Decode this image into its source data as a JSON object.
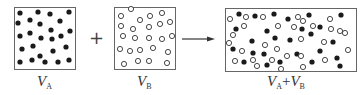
{
  "diagram": {
    "title": "",
    "colors": {
      "stroke": "#555555",
      "filled": "#1a1a1a",
      "hollow_fill": "#ffffff"
    },
    "containers": [
      {
        "id": "A",
        "label_main": "V",
        "label_sub": "A",
        "particle_type": "filled",
        "count": 28
      },
      {
        "id": "B",
        "label_main": "V",
        "label_sub": "B",
        "particle_type": "hollow",
        "count": 28
      },
      {
        "id": "AB",
        "label_main": "V",
        "label_sub": "A",
        "label_plus": "+",
        "label_main2": "V",
        "label_sub2": "B",
        "particle_type": "mixed"
      }
    ],
    "operators": {
      "plus": "+",
      "arrow": "→"
    }
  }
}
